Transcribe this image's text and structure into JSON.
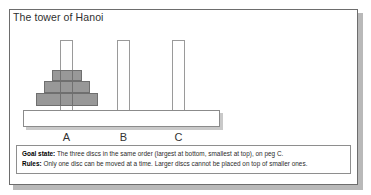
{
  "figure": {
    "title": "The tower of Hanoi",
    "pegs": [
      {
        "id": "A",
        "label": "A",
        "x": 51,
        "width": 13
      },
      {
        "id": "B",
        "label": "B",
        "x": 108,
        "width": 13
      },
      {
        "id": "C",
        "label": "C",
        "x": 163,
        "width": 13
      }
    ],
    "peg_top_y": 31,
    "peg_height": 81,
    "discs": [
      {
        "size": "small",
        "on_peg": "A",
        "x": 43,
        "y": 61,
        "width": 30,
        "height": 11
      },
      {
        "size": "medium",
        "on_peg": "A",
        "x": 35,
        "y": 72,
        "width": 46,
        "height": 12
      },
      {
        "size": "large",
        "on_peg": "A",
        "x": 27,
        "y": 84,
        "width": 62,
        "height": 13
      }
    ],
    "base": {
      "x": 14,
      "y": 101,
      "width": 197,
      "height": 17
    },
    "disc_color": "#585858",
    "peg_color": "#ffffff",
    "frame_color": "#6d6d6d"
  },
  "info": {
    "goal_label": "Goal state:",
    "goal_text": " The three discs in the same order (largest at bottom, smallest at top), on peg C.",
    "rules_label": "Rules:",
    "rules_text": " Only one disc can be moved at a time. Larger discs cannot be placed on top of smaller ones."
  }
}
